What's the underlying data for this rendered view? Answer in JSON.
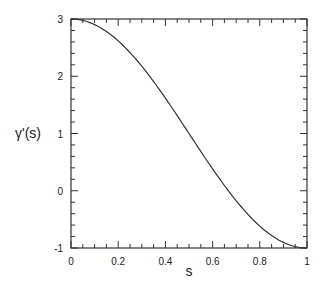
{
  "chart_data": {
    "type": "line",
    "title": "",
    "xlabel": "s",
    "ylabel": "γ'(s)",
    "xlim": [
      0,
      1
    ],
    "ylim": [
      -1,
      3
    ],
    "xticks": [
      "0",
      "0.2",
      "0.4",
      "0.6",
      "0.8",
      "1"
    ],
    "yticks": [
      "-1",
      "0",
      "1",
      "2",
      "3"
    ],
    "grid": false,
    "series": [
      {
        "name": "γ'(s)",
        "formula": "1 + 2cos(πs)",
        "x": [
          0,
          0.1,
          0.2,
          0.3,
          0.4,
          0.5,
          0.6,
          0.7,
          0.8,
          0.9,
          1.0
        ],
        "values": [
          3.0,
          2.9,
          2.62,
          2.18,
          1.62,
          1.0,
          0.38,
          -0.18,
          -0.62,
          -0.9,
          -1.0
        ]
      }
    ]
  }
}
